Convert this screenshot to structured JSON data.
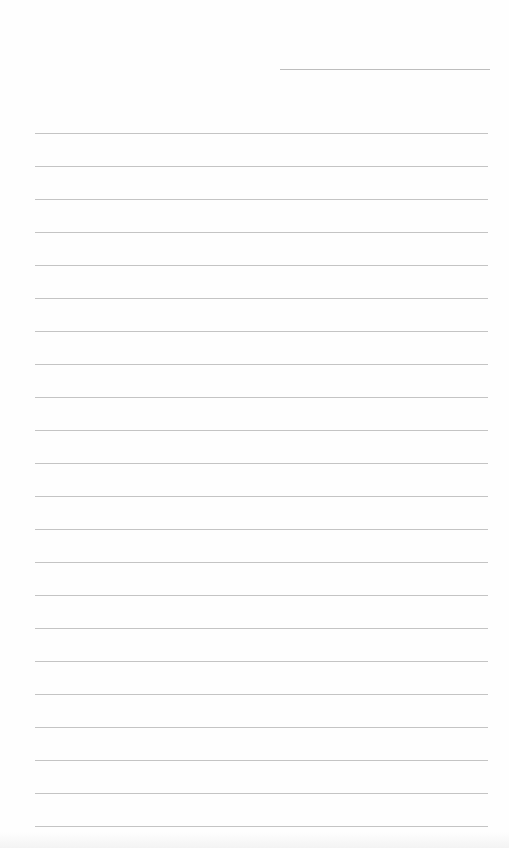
{
  "document": {
    "type": "blank lined paper",
    "background_color": "#fefefe",
    "line_color": "#c4c4c4",
    "date_line": {
      "x1": 280,
      "x2": 490,
      "y": 69
    },
    "ruled_lines": {
      "count": 22,
      "first_y": 133,
      "spacing": 33,
      "x_start": 35,
      "x_end": 488
    }
  }
}
